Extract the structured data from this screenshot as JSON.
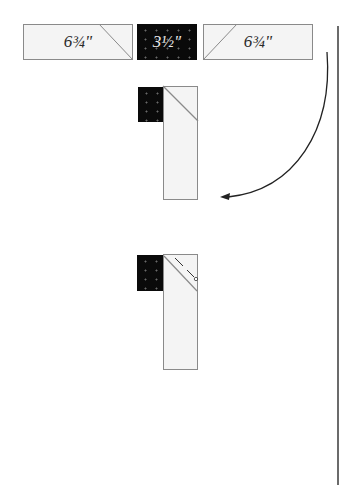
{
  "diagram": {
    "top_row": {
      "strips": [
        {
          "label": "6¾\"",
          "fabric": "light",
          "diagonal": "top-right-down"
        },
        {
          "label": "3½\"",
          "fabric": "dark-print"
        },
        {
          "label": "6¾\"",
          "fabric": "light",
          "diagonal": "top-left-down"
        }
      ]
    },
    "step1": {
      "description": "dark square placed beside light strip with diagonal seam"
    },
    "arrow": {
      "direction": "curved-down-left"
    },
    "step2": {
      "description": "diagonal seam with stitching line and trim mark"
    },
    "colors": {
      "light_fabric": "#f4f4f4",
      "dark_fabric": "#0a0a0a",
      "outline": "#8a8a8a",
      "line": "#222222"
    }
  }
}
